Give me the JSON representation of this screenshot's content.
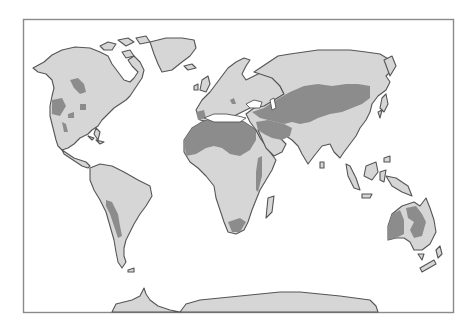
{
  "map": {
    "type": "world-map",
    "subject": "World arid / desert regions",
    "colors": {
      "background": "#ffffff",
      "land": "#d6d6d6",
      "arid_region": "#8c8c8c",
      "coastline": "#555555",
      "frame": "#8a8a8a"
    },
    "continents": [
      "North America",
      "South America",
      "Europe",
      "Africa",
      "Asia",
      "Australia",
      "Antarctica"
    ],
    "arid_regions": [
      "Great Basin / North American deserts",
      "Atacama / Patagonian deserts",
      "Sahara",
      "Kalahari / Namib",
      "Arabian Desert",
      "Central Asian deserts / Gobi",
      "Australian deserts"
    ]
  }
}
